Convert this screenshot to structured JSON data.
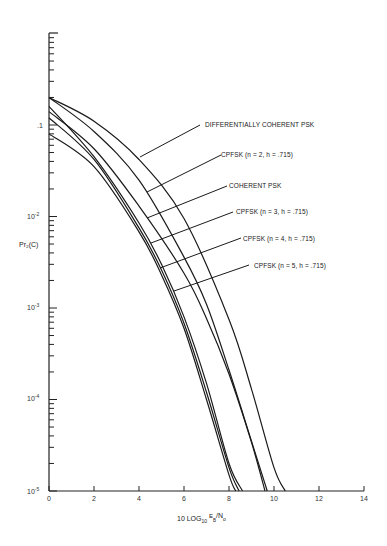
{
  "chart_data": {
    "type": "line",
    "title": "",
    "xlabel": "10 LOG10 EB/No",
    "ylabel": "Pr2(C)",
    "xlim": [
      0,
      14
    ],
    "ylim": [
      1e-05,
      1
    ],
    "yscale": "log",
    "grid": false,
    "legend_position": "inline-callouts",
    "x_ticks": [
      "0",
      "2",
      "4",
      "6",
      "8",
      "10",
      "12",
      "14"
    ],
    "y_ticks": [
      "10^-5",
      "10^-4",
      "10^-3",
      "10^-2",
      ".1"
    ],
    "series": [
      {
        "name": "DIFFERENTIALLY COHERENT PSK",
        "x": [
          0,
          2,
          4,
          6,
          8,
          9,
          10,
          10.5
        ],
        "values": [
          0.2,
          0.11,
          0.042,
          0.0095,
          0.00075,
          0.00013,
          1.8e-05,
          1e-05
        ]
      },
      {
        "name": "CPFSK (n = 2, h = .715)",
        "x": [
          0,
          2,
          4,
          6,
          7,
          8,
          9,
          9.7
        ],
        "values": [
          0.2,
          0.085,
          0.025,
          0.0036,
          0.0011,
          0.00021,
          3.5e-05,
          1e-05
        ]
      },
      {
        "name": "COHERENT PSK",
        "x": [
          0,
          2,
          4,
          6,
          7,
          8,
          9,
          9.6
        ],
        "values": [
          0.14,
          0.055,
          0.013,
          0.0024,
          0.00077,
          0.00019,
          3.4e-05,
          1e-05
        ]
      },
      {
        "name": "CPFSK (n = 3, h = .715)",
        "x": [
          0,
          2,
          4,
          5,
          6,
          7,
          8,
          8.6
        ],
        "values": [
          0.16,
          0.045,
          0.0085,
          0.003,
          0.0008,
          0.00015,
          2e-05,
          1e-05
        ]
      },
      {
        "name": "CPFSK (n = 4, h = .715)",
        "x": [
          0,
          2,
          4,
          5,
          6,
          7,
          8,
          8.45
        ],
        "values": [
          0.12,
          0.042,
          0.0075,
          0.0026,
          0.00068,
          0.00012,
          1.8e-05,
          1e-05
        ]
      },
      {
        "name": "CPFSK (n = 5, h = .715)",
        "x": [
          0,
          2,
          4,
          5,
          6,
          7,
          8,
          8.3
        ],
        "values": [
          0.08,
          0.035,
          0.0068,
          0.0023,
          0.0006,
          0.0001,
          1.5e-05,
          1e-05
        ]
      }
    ]
  },
  "labels": {
    "y_axis_title": "Pr₂(C)",
    "x_axis_title_main": "10 LOG",
    "x_axis_title_sub": "10",
    "x_axis_title_e": "E",
    "x_axis_title_b": "B",
    "x_axis_title_n": "/N",
    "x_axis_title_o": "o",
    "curve_labels": [
      "DIFFERENTIALLY COHERENT PSK",
      "CPFSK (n = 2, h = .715)",
      "COHERENT PSK",
      "CPFSK (n = 3, h = .715)",
      "CPFSK (n = 4, h = .715)",
      "CPFSK (n = 5, h = .715)"
    ],
    "x_ticks": [
      "0",
      "2",
      "4",
      "6",
      "8",
      "10",
      "12",
      "14"
    ],
    "y_tick_1": ".1",
    "y_tick_2": "10",
    "y_tick_2_exp": "-2",
    "y_tick_3": "10",
    "y_tick_3_exp": "-3",
    "y_tick_4": "10",
    "y_tick_4_exp": "-4",
    "y_tick_5": "10",
    "y_tick_5_exp": "-5"
  }
}
